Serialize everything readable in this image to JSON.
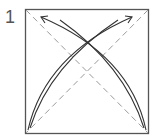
{
  "diagram": {
    "step_number": "1",
    "type": "origami-fold-step",
    "paper": "square",
    "crease_lines": [
      "diagonal-top-left-to-bottom-right",
      "diagonal-top-right-to-bottom-left"
    ],
    "fold_arrows": [
      {
        "from": "bottom-left",
        "to": "top-right"
      },
      {
        "from": "bottom-right",
        "to": "top-left"
      }
    ],
    "colors": {
      "outline": "#555555",
      "crease": "#9a9a9a",
      "arrow": "#333333"
    }
  }
}
